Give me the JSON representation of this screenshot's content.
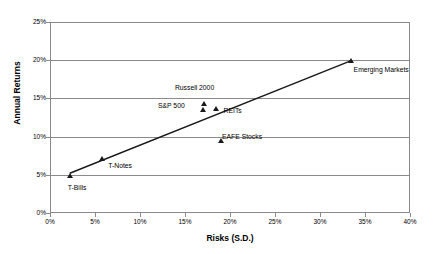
{
  "chart_data": {
    "type": "scatter",
    "title": "",
    "xlabel": "Risks (S.D.)",
    "ylabel": "Annual Returns",
    "xlim": [
      0,
      40
    ],
    "ylim": [
      0,
      25
    ],
    "xticks": [
      "0%",
      "5%",
      "10%",
      "15%",
      "20%",
      "25%",
      "30%",
      "35%",
      "40%"
    ],
    "xtick_values": [
      0,
      5,
      10,
      15,
      20,
      25,
      30,
      35,
      40
    ],
    "yticks": [
      "0%",
      "5%",
      "10%",
      "15%",
      "20%",
      "25%"
    ],
    "ytick_values": [
      0,
      5,
      10,
      15,
      20,
      25
    ],
    "grid": "horizontal",
    "legend": "none",
    "points": [
      {
        "name": "T-Bills",
        "x": 2.2,
        "y": 4.8,
        "label": "T-Bills",
        "label_dx": -2,
        "label_dy": 12
      },
      {
        "name": "T-Notes",
        "x": 5.8,
        "y": 7.1,
        "label": "T-Notes",
        "label_dx": 6,
        "label_dy": 7
      },
      {
        "name": "S&P 500",
        "x": 17.0,
        "y": 13.5,
        "label": "S&P 500",
        "label_dx": -45,
        "label_dy": -4
      },
      {
        "name": "Russell 2000",
        "x": 17.1,
        "y": 14.3,
        "label": "Russell 2000",
        "label_dx": -29,
        "label_dy": -16
      },
      {
        "name": "REITs",
        "x": 18.4,
        "y": 13.6,
        "label": "REITs",
        "label_dx": 8,
        "label_dy": 2
      },
      {
        "name": "EAFE Stocks",
        "x": 19.0,
        "y": 9.4,
        "label": "EAFE Stocks",
        "label_dx": 1,
        "label_dy": -4
      },
      {
        "name": "Emerging Markets",
        "x": 33.4,
        "y": 19.9,
        "label": "Emerging Markets",
        "label_dx": 3,
        "label_dy": 9
      }
    ],
    "trendline": {
      "type": "linear",
      "x_start": 2.2,
      "y_start": 5.2,
      "x_end": 33.4,
      "y_end": 19.9
    },
    "colors": {
      "marker": "#1a1a1a",
      "trendline": "#1a1a1a",
      "grid": "#8a8a8a",
      "frame": "#8a8a8a",
      "text": "#000000",
      "background": "#ffffff"
    }
  }
}
